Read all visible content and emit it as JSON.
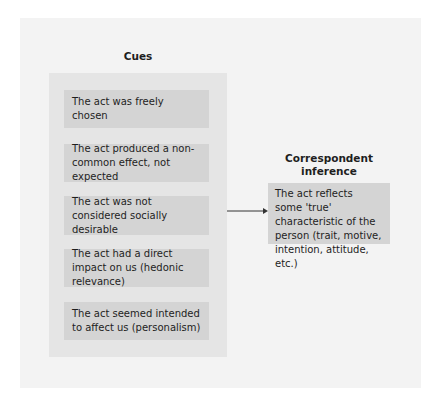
{
  "cues": {
    "title": "Cues",
    "items": [
      "The act was freely chosen",
      "The act produced a non-common effect, not expected",
      "The act was not considered socially desirable",
      "The act had a direct impact on us (hedonic relevance)",
      "The act seemed intended to affect us (personalism)"
    ]
  },
  "inference": {
    "title": "Correspondent inference",
    "text": "The act reflects some 'true' characteristic of the person (trait, motive, intention, attitude, etc.)"
  },
  "connector": {
    "icon": "arrow-right-icon"
  }
}
